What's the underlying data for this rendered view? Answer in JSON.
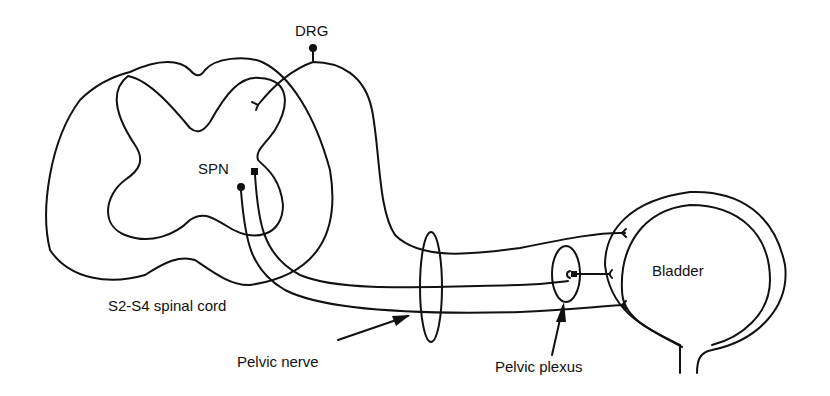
{
  "diagram": {
    "labels": {
      "drg": "DRG",
      "spn": "SPN",
      "spinal_cord": "S2-S4 spinal cord",
      "pelvic_nerve": "Pelvic nerve",
      "pelvic_plexus": "Pelvic plexus",
      "bladder": "Bladder"
    },
    "colors": {
      "stroke": "#111111",
      "background": "#ffffff"
    }
  }
}
